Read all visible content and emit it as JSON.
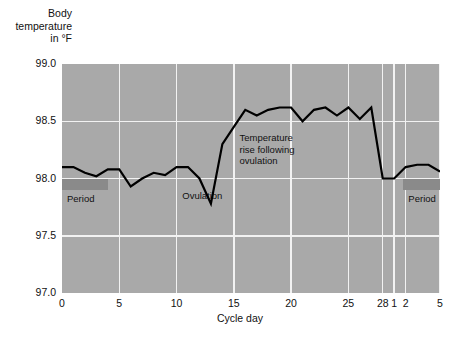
{
  "chart_data": {
    "type": "line",
    "title": "",
    "ylabel": "Body\ntemperature\nin °F",
    "xlabel": "Cycle day",
    "ylim": [
      97.0,
      99.0
    ],
    "xlim": [
      0,
      33
    ],
    "grid": true,
    "legend": "none",
    "y_ticks": [
      {
        "value": 99.0,
        "label": "99.0"
      },
      {
        "value": 98.5,
        "label": "98.5"
      },
      {
        "value": 98.0,
        "label": "98.0"
      },
      {
        "value": 97.5,
        "label": "97.5"
      },
      {
        "value": 97.0,
        "label": "97.0"
      }
    ],
    "x_ticks": [
      {
        "value": 0,
        "label": "0"
      },
      {
        "value": 5,
        "label": "5"
      },
      {
        "value": 10,
        "label": "10"
      },
      {
        "value": 15,
        "label": "15"
      },
      {
        "value": 20,
        "label": "20"
      },
      {
        "value": 25,
        "label": "25"
      },
      {
        "value": 28,
        "label": "28"
      },
      {
        "value": 29,
        "label": "1"
      },
      {
        "value": 30,
        "label": "2"
      },
      {
        "value": 33,
        "label": "5"
      }
    ],
    "series": [
      {
        "name": "Basal body temperature",
        "x": [
          0,
          1,
          2,
          3,
          4,
          5,
          6,
          7,
          8,
          9,
          10,
          11,
          12,
          13,
          14,
          15,
          16,
          17,
          18,
          19,
          20,
          21,
          22,
          23,
          24,
          25,
          26,
          27,
          28,
          29,
          30,
          31,
          32,
          33
        ],
        "values": [
          98.1,
          98.1,
          98.05,
          98.02,
          98.08,
          98.08,
          97.93,
          98.0,
          98.05,
          98.03,
          98.1,
          98.1,
          98.0,
          97.78,
          98.3,
          98.45,
          98.6,
          98.55,
          98.6,
          98.62,
          98.62,
          98.5,
          98.6,
          98.62,
          98.55,
          98.62,
          98.52,
          98.62,
          98.0,
          98.0,
          98.1,
          98.12,
          98.12,
          98.06
        ]
      }
    ],
    "annotations": [
      {
        "name": "period-left",
        "text": "Period",
        "type": "band",
        "x_start": 0,
        "x_end": 4,
        "y": 97.95
      },
      {
        "name": "ovulation",
        "text": "Ovulation",
        "type": "label",
        "x": 10.5,
        "y": 97.85
      },
      {
        "name": "temp-rise",
        "text": "Temperature\nrise following\novulation",
        "type": "label",
        "x": 15.5,
        "y": 98.35
      },
      {
        "name": "period-right",
        "text": "Period",
        "type": "band",
        "x_start": 29.8,
        "x_end": 33.0,
        "y": 97.95
      }
    ]
  },
  "labels": {
    "y_axis_title": "Body\ntemperature\nin °F",
    "x_axis_title": "Cycle day",
    "period_left": "Period",
    "period_right": "Period",
    "ovulation": "Ovulation",
    "temp_rise": "Temperature\nrise following\novulation"
  },
  "colors": {
    "plot_background": "#a9a9a9",
    "gridline": "#f2f2f2",
    "curve": "#000000",
    "period_band": "#8a8a8a",
    "page_background": "#ffffff",
    "text": "#111111"
  }
}
